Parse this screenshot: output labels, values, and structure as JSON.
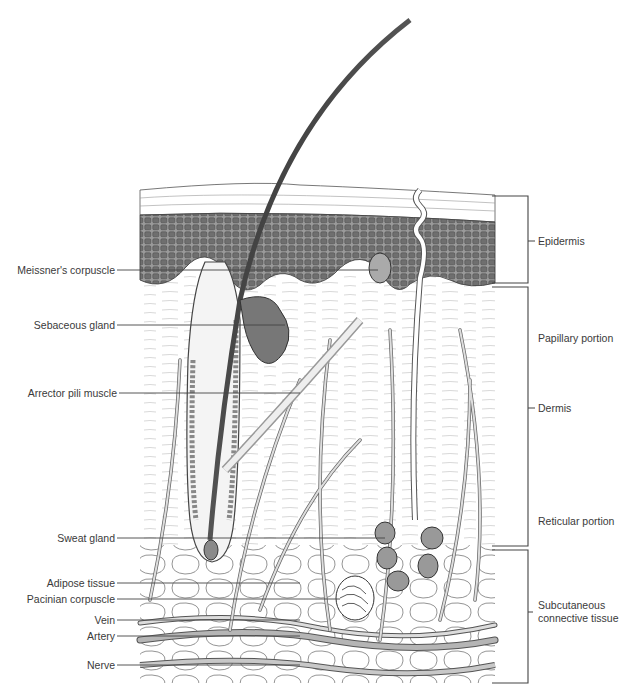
{
  "diagram": {
    "left_labels": [
      {
        "id": "meissners-corpuscle",
        "text": "Meissner's corpuscle",
        "y": 270
      },
      {
        "id": "sebaceous-gland",
        "text": "Sebaceous gland",
        "y": 325
      },
      {
        "id": "arrector-pili-muscle",
        "text": "Arrector pili muscle",
        "y": 393
      },
      {
        "id": "sweat-gland",
        "text": "Sweat gland",
        "y": 538
      },
      {
        "id": "adipose-tissue",
        "text": "Adipose tissue",
        "y": 583
      },
      {
        "id": "pacinian-corpuscle",
        "text": "Pacinian corpuscle",
        "y": 599
      },
      {
        "id": "vein",
        "text": "Vein",
        "y": 620
      },
      {
        "id": "artery",
        "text": "Artery",
        "y": 636
      },
      {
        "id": "nerve",
        "text": "Nerve",
        "y": 665
      }
    ],
    "right_labels": [
      {
        "id": "epidermis",
        "text": "Epidermis",
        "y": 241
      },
      {
        "id": "papillary-portion",
        "text": "Papillary portion",
        "y": 338
      },
      {
        "id": "dermis",
        "text": "Dermis",
        "y": 408
      },
      {
        "id": "reticular-portion",
        "text": "Reticular portion",
        "y": 521
      },
      {
        "id": "subcutaneous-connective-tissue",
        "text": "Subcutaneous\nconnective tissue",
        "y": 592
      }
    ],
    "brackets": [
      {
        "id": "epidermis-bracket",
        "top": 196,
        "bottom": 283
      },
      {
        "id": "dermis-bracket",
        "top": 287,
        "bottom": 546
      },
      {
        "id": "subcutaneous-bracket",
        "top": 550,
        "bottom": 683
      }
    ]
  },
  "labels": {
    "meissners_corpuscle": "Meissner's corpuscle",
    "sebaceous_gland": "Sebaceous gland",
    "arrector_pili_muscle": "Arrector pili muscle",
    "sweat_gland": "Sweat gland",
    "adipose_tissue": "Adipose tissue",
    "pacinian_corpuscle": "Pacinian corpuscle",
    "vein": "Vein",
    "artery": "Artery",
    "nerve": "Nerve",
    "epidermis": "Epidermis",
    "papillary_portion": "Papillary portion",
    "dermis": "Dermis",
    "reticular_portion": "Reticular portion",
    "subcutaneous_line1": "Subcutaneous",
    "subcutaneous_line2": "connective tissue"
  },
  "colors": {
    "ink": "#3a3a3a",
    "epidermis_fill": "#8a8a8a",
    "vessel_fill": "#b5b5b5",
    "hair_dark": "#2a2a2a",
    "background": "#ffffff"
  }
}
